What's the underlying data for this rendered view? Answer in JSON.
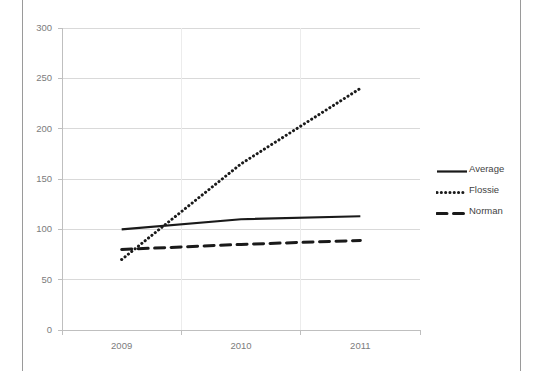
{
  "chart_data": {
    "type": "line",
    "title": "",
    "subtitle": "",
    "xlabel": "",
    "ylabel": "",
    "categories": [
      "2009",
      "2010",
      "2011"
    ],
    "x": [
      2009,
      2010,
      2011
    ],
    "series": [
      {
        "name": "Average",
        "values": [
          100,
          110,
          113
        ],
        "style": "solid",
        "color": "#1a1a1a"
      },
      {
        "name": "Flossie",
        "values": [
          70,
          165,
          240
        ],
        "style": "dotted",
        "color": "#1a1a1a"
      },
      {
        "name": "Norman",
        "values": [
          80,
          85,
          89
        ],
        "style": "dashed",
        "color": "#1a1a1a"
      }
    ],
    "ylim": [
      0,
      300
    ],
    "ytick_labels": [
      "0",
      "50",
      "100",
      "150",
      "200",
      "250",
      "300"
    ],
    "ytick_values": [
      0,
      50,
      100,
      150,
      200,
      250,
      300
    ],
    "xtick_labels": [
      "2009",
      "2010",
      "2011"
    ],
    "grid": {
      "horizontal": true,
      "vertical": true
    },
    "legend": {
      "position": "right",
      "entries": [
        "Average",
        "Flossie",
        "Norman"
      ]
    },
    "axis_color": "#bfbfbf",
    "grid_color": "#d9d9d9",
    "tick_label_color": "#7c7c7c",
    "background_color": "#ffffff",
    "border_color": "#9a9a9a"
  },
  "yticks": [
    {
      "label": "300"
    },
    {
      "label": "250"
    },
    {
      "label": "200"
    },
    {
      "label": "150"
    },
    {
      "label": "100"
    },
    {
      "label": "50"
    },
    {
      "label": "0"
    }
  ],
  "xticks": [
    {
      "label": "2009"
    },
    {
      "label": "2010"
    },
    {
      "label": "2011"
    }
  ],
  "legend": {
    "items": [
      {
        "label": "Average",
        "swatch": "solid-line-icon"
      },
      {
        "label": "Flossie",
        "swatch": "dotted-line-icon"
      },
      {
        "label": "Norman",
        "swatch": "dashed-line-icon"
      }
    ]
  }
}
